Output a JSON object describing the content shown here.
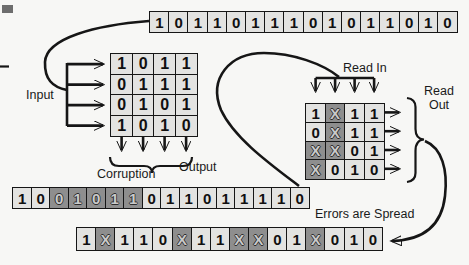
{
  "colors": {
    "page_bg": "#f7f7f5",
    "cell_bg": "#e3e3e1",
    "corrupt_bg": "#8e8e8e",
    "line": "#161616"
  },
  "labels": {
    "input": "Input",
    "corruption": "Corruption",
    "output": "Output",
    "read_in": "Read In",
    "read_out": "Read\nOut",
    "errors_spread": "Errors are Spread"
  },
  "icons": {
    "arrowhead": "solid-triangle-arrowhead",
    "brace": "curly-brace"
  },
  "bit_rows": {
    "original": {
      "cells": [
        {
          "v": "1"
        },
        {
          "v": "0"
        },
        {
          "v": "1"
        },
        {
          "v": "1"
        },
        {
          "v": "0"
        },
        {
          "v": "1"
        },
        {
          "v": "1"
        },
        {
          "v": "1"
        },
        {
          "v": "0"
        },
        {
          "v": "1"
        },
        {
          "v": "0"
        },
        {
          "v": "1"
        },
        {
          "v": "1"
        },
        {
          "v": "0"
        },
        {
          "v": "1"
        },
        {
          "v": "0"
        }
      ]
    },
    "corrupted_stream": {
      "cells": [
        {
          "v": "1"
        },
        {
          "v": "0"
        },
        {
          "v": "0",
          "corrupt": true
        },
        {
          "v": "1",
          "corrupt": true
        },
        {
          "v": "0",
          "corrupt": true
        },
        {
          "v": "1",
          "corrupt": true
        },
        {
          "v": "1",
          "corrupt": true
        },
        {
          "v": "0"
        },
        {
          "v": "1"
        },
        {
          "v": "1"
        },
        {
          "v": "0"
        },
        {
          "v": "1"
        },
        {
          "v": "1"
        },
        {
          "v": "1"
        },
        {
          "v": "1"
        },
        {
          "v": "0"
        }
      ]
    },
    "spread": {
      "cells": [
        {
          "v": "1"
        },
        {
          "v": "X",
          "corrupt": true
        },
        {
          "v": "1"
        },
        {
          "v": "1"
        },
        {
          "v": "0"
        },
        {
          "v": "X",
          "corrupt": true
        },
        {
          "v": "1"
        },
        {
          "v": "1"
        },
        {
          "v": "X",
          "corrupt": true
        },
        {
          "v": "X",
          "corrupt": true
        },
        {
          "v": "0"
        },
        {
          "v": "1"
        },
        {
          "v": "X",
          "corrupt": true
        },
        {
          "v": "0"
        },
        {
          "v": "1"
        },
        {
          "v": "0"
        }
      ]
    }
  },
  "matrices": {
    "write": {
      "rows": [
        [
          {
            "v": "1"
          },
          {
            "v": "0"
          },
          {
            "v": "1"
          },
          {
            "v": "1"
          }
        ],
        [
          {
            "v": "0"
          },
          {
            "v": "1"
          },
          {
            "v": "1"
          },
          {
            "v": "1"
          }
        ],
        [
          {
            "v": "0"
          },
          {
            "v": "1"
          },
          {
            "v": "0"
          },
          {
            "v": "1"
          }
        ],
        [
          {
            "v": "1"
          },
          {
            "v": "0"
          },
          {
            "v": "1"
          },
          {
            "v": "0"
          }
        ]
      ]
    },
    "read": {
      "rows": [
        [
          {
            "v": "1"
          },
          {
            "v": "X",
            "corrupt": true
          },
          {
            "v": "1"
          },
          {
            "v": "1"
          }
        ],
        [
          {
            "v": "0"
          },
          {
            "v": "X",
            "corrupt": true
          },
          {
            "v": "1"
          },
          {
            "v": "1"
          }
        ],
        [
          {
            "v": "X",
            "corrupt": true
          },
          {
            "v": "X",
            "corrupt": true
          },
          {
            "v": "0"
          },
          {
            "v": "1"
          }
        ],
        [
          {
            "v": "X",
            "corrupt": true
          },
          {
            "v": "0"
          },
          {
            "v": "1"
          },
          {
            "v": "0"
          }
        ]
      ]
    }
  }
}
